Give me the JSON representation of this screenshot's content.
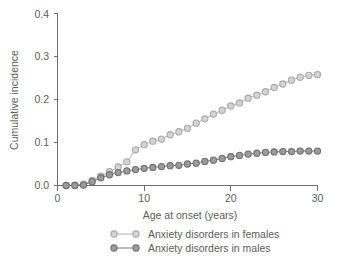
{
  "chart_data": {
    "type": "line",
    "title": "",
    "xlabel": "Age at onset (years)",
    "ylabel": "Cumulative incidence",
    "xlim": [
      0,
      30
    ],
    "ylim": [
      0.0,
      0.4
    ],
    "xticks": [
      0,
      10,
      20,
      30
    ],
    "xticklabels": [
      "0",
      "10",
      "20",
      "30"
    ],
    "yticks": [
      0.0,
      0.1,
      0.2,
      0.3,
      0.4
    ],
    "yticklabels": [
      "0.0",
      "0.1",
      "0.2",
      "0.3",
      "0.4"
    ],
    "grid": false,
    "legend_position": "below",
    "markers": "circle",
    "x": [
      1,
      2,
      3,
      4,
      5,
      6,
      7,
      8,
      9,
      10,
      11,
      12,
      13,
      14,
      15,
      16,
      17,
      18,
      19,
      20,
      21,
      22,
      23,
      24,
      25,
      26,
      27,
      28,
      29,
      30
    ],
    "series": [
      {
        "name": "Anxiety disorders in females",
        "color": "#d4d4d4",
        "edge_color": "#a8a8a8",
        "values": [
          0.0,
          0.001,
          0.003,
          0.012,
          0.022,
          0.032,
          0.043,
          0.055,
          0.083,
          0.095,
          0.103,
          0.108,
          0.118,
          0.125,
          0.133,
          0.145,
          0.155,
          0.166,
          0.175,
          0.185,
          0.192,
          0.203,
          0.21,
          0.218,
          0.228,
          0.236,
          0.245,
          0.252,
          0.256,
          0.258
        ]
      },
      {
        "name": "Anxiety disorders in males",
        "color": "#9b9b9b",
        "edge_color": "#6f6f6f",
        "values": [
          0.0,
          0.0,
          0.001,
          0.009,
          0.018,
          0.025,
          0.03,
          0.034,
          0.037,
          0.04,
          0.042,
          0.044,
          0.046,
          0.047,
          0.05,
          0.052,
          0.056,
          0.059,
          0.063,
          0.067,
          0.07,
          0.073,
          0.075,
          0.077,
          0.078,
          0.079,
          0.079,
          0.08,
          0.08,
          0.08
        ]
      }
    ]
  },
  "legend": {
    "items": [
      {
        "label": "Anxiety disorders in females"
      },
      {
        "label": "Anxiety disorders in males"
      }
    ]
  }
}
